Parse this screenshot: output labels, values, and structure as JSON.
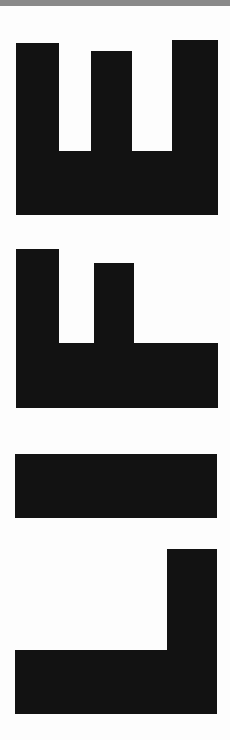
{
  "artwork": {
    "word": "LIFE",
    "orientation": "rotated 90° counterclockwise, read bottom to top",
    "letters": [
      "L",
      "I",
      "F",
      "E"
    ],
    "colors": {
      "ink": "#121212",
      "paper": "#fdfdfd",
      "top_band": "#8a8a8a"
    }
  }
}
